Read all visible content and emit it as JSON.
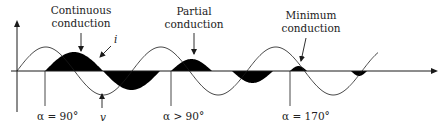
{
  "figure": {
    "type": "diagram",
    "width": 442,
    "height": 127,
    "colors": {
      "line": "#1a1a1a",
      "fill": "#000000",
      "text": "#222222",
      "background": "#ffffff"
    },
    "axis": {
      "origin_x": 17,
      "axis_y": 71,
      "y_axis_top": 20,
      "y_axis_bottom": 112,
      "x_axis_end": 438
    },
    "voltage": {
      "label": "v",
      "start_x": 17,
      "period": 115,
      "amplitude": 24,
      "end_x": 378
    },
    "current": {
      "label": "i",
      "amplitude": 19
    },
    "regions": [
      {
        "name": "continuous",
        "title_line1": "Continuous",
        "title_line2": "conduction",
        "alpha_label": "α = 90°",
        "alpha_x": 45,
        "lobes": [
          {
            "start": 45,
            "end": 103,
            "sign": 1,
            "height": 19
          },
          {
            "start": 103,
            "end": 160,
            "sign": -1,
            "height": 19
          }
        ],
        "title_x": 81,
        "title_y1": 14,
        "title_y2": 27,
        "arrow": {
          "x1": 81,
          "y1": 33,
          "x2": 81,
          "y2": 51
        }
      },
      {
        "name": "partial",
        "title_line1": "Partial",
        "title_line2": "conduction",
        "alpha_label": "α > 90°",
        "alpha_x": 171,
        "lobes": [
          {
            "start": 171,
            "end": 212,
            "sign": 1,
            "height": 12
          },
          {
            "start": 232,
            "end": 273,
            "sign": -1,
            "height": 12
          }
        ],
        "title_x": 194,
        "title_y1": 15,
        "title_y2": 28,
        "arrow": {
          "x1": 194,
          "y1": 33,
          "x2": 194,
          "y2": 54
        }
      },
      {
        "name": "minimum",
        "title_line1": "Minimum",
        "title_line2": "conduction",
        "alpha_label": "α = 170°",
        "alpha_x": 290,
        "lobes": [
          {
            "start": 290,
            "end": 307,
            "sign": 1,
            "height": 5
          },
          {
            "start": 351,
            "end": 367,
            "sign": -1,
            "height": 5
          }
        ],
        "title_x": 311,
        "title_y1": 19,
        "title_y2": 32,
        "arrow": {
          "x1": 306,
          "y1": 38,
          "x2": 301,
          "y2": 61
        }
      }
    ],
    "annotations": {
      "i_label": {
        "text": "i",
        "x": 114,
        "y": 43
      },
      "i_arrow": {
        "x1": 111,
        "y1": 46,
        "x2": 100,
        "y2": 57
      },
      "v_label": {
        "text": "v",
        "x": 100,
        "y": 121
      },
      "v_arrow": {
        "x1": 102,
        "y1": 108,
        "x2": 102,
        "y2": 94
      },
      "alpha_line_bottom": 106,
      "alpha_label_y": 120
    }
  }
}
